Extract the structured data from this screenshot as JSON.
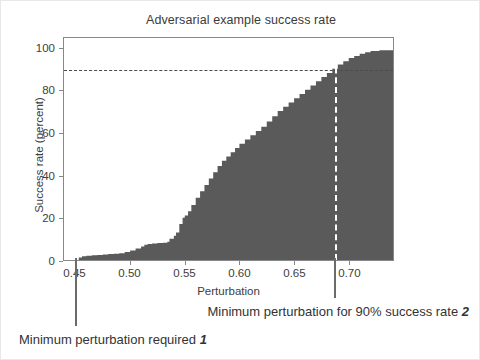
{
  "figure": {
    "background": "#ffffff",
    "border_color": "#e8e8e8"
  },
  "chart_data": {
    "type": "area",
    "title": "Adversarial example success rate",
    "xlabel": "Perturbation",
    "ylabel": "Success rate (percent)",
    "xlim": [
      0.4395,
      0.7405
    ],
    "ylim": [
      0,
      105
    ],
    "grid": false,
    "legend": null,
    "fill_color": "#5a5a5a",
    "axis_color": "#888888",
    "xticks": [
      0.45,
      0.5,
      0.55,
      0.6,
      0.65,
      0.7
    ],
    "xtick_labels": [
      "0.45",
      "0.50",
      "0.55",
      "0.60",
      "0.65",
      "0.70"
    ],
    "yticks": [
      0,
      20,
      40,
      60,
      80,
      100
    ],
    "ytick_labels": [
      "0",
      "20",
      "40",
      "60",
      "80",
      "100"
    ],
    "x": [
      0.4395,
      0.45,
      0.453,
      0.456,
      0.46,
      0.465,
      0.47,
      0.475,
      0.48,
      0.485,
      0.49,
      0.495,
      0.5,
      0.505,
      0.51,
      0.513,
      0.516,
      0.52,
      0.525,
      0.53,
      0.534,
      0.536,
      0.54,
      0.542,
      0.545,
      0.548,
      0.55,
      0.553,
      0.556,
      0.56,
      0.564,
      0.568,
      0.572,
      0.576,
      0.58,
      0.584,
      0.588,
      0.592,
      0.596,
      0.6,
      0.605,
      0.61,
      0.615,
      0.62,
      0.625,
      0.63,
      0.635,
      0.64,
      0.645,
      0.65,
      0.655,
      0.66,
      0.665,
      0.67,
      0.675,
      0.68,
      0.685,
      0.69,
      0.695,
      0.7,
      0.705,
      0.71,
      0.715,
      0.72,
      0.728,
      0.7405
    ],
    "y": [
      0,
      0,
      1.2,
      1.8,
      2.0,
      2.2,
      2.4,
      2.6,
      2.8,
      3.0,
      3.2,
      3.8,
      4.5,
      5.4,
      6.4,
      7.2,
      7.6,
      7.8,
      8.0,
      8.2,
      8.6,
      10.0,
      11.5,
      13.0,
      17.0,
      20.0,
      21.0,
      23.0,
      26.0,
      29.5,
      32.5,
      35.5,
      38.5,
      41.5,
      44.5,
      47.0,
      49.0,
      51.0,
      53.0,
      55.0,
      57.0,
      59.0,
      61.0,
      63.0,
      65.5,
      68.0,
      70.5,
      72.5,
      74.5,
      76.5,
      78.5,
      80.5,
      82.5,
      84.5,
      86.5,
      88.5,
      90.5,
      92.5,
      94.0,
      95.5,
      96.5,
      97.5,
      98.3,
      98.8,
      99.2,
      99.3
    ],
    "reference_lines": [
      {
        "name": "success-rate-90-horizontal",
        "orientation": "horizontal",
        "value": 90,
        "style": "dashed",
        "color": "#4c4c4c"
      },
      {
        "name": "minimum-perturbation-90-vertical",
        "orientation": "vertical",
        "value": 0.6855,
        "style": "dashed",
        "color": "#ffffff"
      }
    ]
  },
  "annotations": [
    {
      "id": "annotation-1",
      "text": "Minimum perturbation required ",
      "marker": "1",
      "pointer_x": 0.45,
      "pointer_color": "#6b6b6b"
    },
    {
      "id": "annotation-2",
      "text": "Minimum perturbation for 90% success rate ",
      "marker": "2",
      "pointer_x": 0.6855,
      "pointer_color": "#6b6b6b"
    }
  ]
}
